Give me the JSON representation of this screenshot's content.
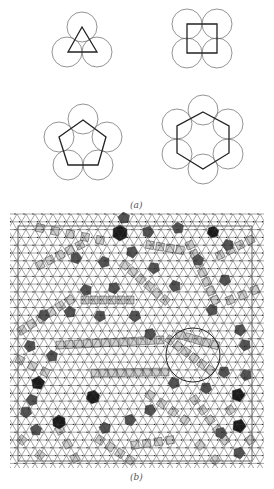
{
  "figure": {
    "panel_a": {
      "label": "(a)",
      "label_pos": [
        137,
        206
      ],
      "circle_radius": 15,
      "motifs": [
        {
          "name": "triangle-motif",
          "sides": 3,
          "circles": [
            [
              82,
              27
            ],
            [
              67,
              52
            ],
            [
              97,
              52
            ]
          ],
          "polygon": [
            [
              82,
              27
            ],
            [
              68,
              52
            ],
            [
              97,
              52
            ]
          ]
        },
        {
          "name": "square-motif",
          "sides": 4,
          "circles": [
            [
              187,
              24
            ],
            [
              217,
              24
            ],
            [
              187,
              53
            ],
            [
              217,
              53
            ]
          ],
          "polygon": [
            [
              187,
              24
            ],
            [
              217,
              24
            ],
            [
              217,
              53
            ],
            [
              187,
              53
            ]
          ]
        },
        {
          "name": "pentagon-motif",
          "sides": 5,
          "circles": [
            [
              83,
              119
            ],
            [
              59,
              137
            ],
            [
              107,
              137
            ],
            [
              68,
              165
            ],
            [
              98,
              165
            ]
          ],
          "polygon": [
            [
              83,
              120
            ],
            [
              106,
              137
            ],
            [
              98,
              165
            ],
            [
              68,
              165
            ],
            [
              59,
              137
            ]
          ]
        },
        {
          "name": "hexagon-motif",
          "sides": 6,
          "circles": [
            [
              203,
              110
            ],
            [
              228,
              124
            ],
            [
              228,
              154
            ],
            [
              203,
              169
            ],
            [
              177,
              154
            ],
            [
              177,
              124
            ]
          ],
          "polygon": [
            [
              203,
              112
            ],
            [
              229,
              126
            ],
            [
              229,
              153
            ],
            [
              203,
              169
            ],
            [
              177,
              153
            ],
            [
              177,
              126
            ]
          ]
        }
      ]
    },
    "panel_b": {
      "label": "(b)",
      "label_pos": [
        137,
        478
      ],
      "box": {
        "x": 18,
        "y": 226,
        "w": 234,
        "h": 235
      },
      "lattice_spacing": 9,
      "highlight_circle": {
        "cx": 193,
        "cy": 355,
        "r": 27
      },
      "colors": {
        "light": "#d0d0d0",
        "mid": "#8a8a8a",
        "dark": "#555555",
        "black": "#1a1a1a",
        "line": "#333333"
      },
      "tiles": [
        {
          "kind": "hex",
          "cx": 93,
          "cy": 397,
          "r": 7,
          "shade": "black"
        },
        {
          "kind": "hex",
          "cx": 59,
          "cy": 422,
          "r": 7,
          "shade": "black"
        },
        {
          "kind": "hex",
          "cx": 120,
          "cy": 233,
          "r": 8,
          "shade": "black"
        },
        {
          "kind": "hex",
          "cx": 213,
          "cy": 232,
          "r": 6,
          "shade": "black"
        },
        {
          "kind": "pent",
          "cx": 38,
          "cy": 383,
          "r": 7,
          "shade": "black"
        },
        {
          "kind": "pent",
          "cx": 239,
          "cy": 453,
          "r": 6,
          "shade": "dark"
        },
        {
          "kind": "pent",
          "cx": 238,
          "cy": 395,
          "r": 7,
          "shade": "black"
        },
        {
          "kind": "pent",
          "cx": 239,
          "cy": 426,
          "r": 7,
          "shade": "black"
        },
        {
          "kind": "pent",
          "cx": 124,
          "cy": 218,
          "r": 6,
          "shade": "dark"
        },
        {
          "kind": "pent",
          "cx": 148,
          "cy": 232,
          "r": 6,
          "shade": "dark"
        },
        {
          "kind": "pent",
          "cx": 178,
          "cy": 228,
          "r": 6,
          "shade": "dark"
        },
        {
          "kind": "pent",
          "cx": 76,
          "cy": 258,
          "r": 6,
          "shade": "dark"
        },
        {
          "kind": "pent",
          "cx": 104,
          "cy": 262,
          "r": 6,
          "shade": "dark"
        },
        {
          "kind": "pent",
          "cx": 132,
          "cy": 252,
          "r": 6,
          "shade": "dark"
        },
        {
          "kind": "pent",
          "cx": 154,
          "cy": 268,
          "r": 6,
          "shade": "dark"
        },
        {
          "kind": "pent",
          "cx": 86,
          "cy": 290,
          "r": 6,
          "shade": "dark"
        },
        {
          "kind": "pent",
          "cx": 114,
          "cy": 288,
          "r": 6,
          "shade": "dark"
        },
        {
          "kind": "pent",
          "cx": 44,
          "cy": 315,
          "r": 6,
          "shade": "dark"
        },
        {
          "kind": "pent",
          "cx": 70,
          "cy": 312,
          "r": 6,
          "shade": "dark"
        },
        {
          "kind": "pent",
          "cx": 100,
          "cy": 316,
          "r": 6,
          "shade": "dark"
        },
        {
          "kind": "pent",
          "cx": 135,
          "cy": 316,
          "r": 6,
          "shade": "dark"
        },
        {
          "kind": "pent",
          "cx": 150,
          "cy": 334,
          "r": 6,
          "shade": "dark"
        },
        {
          "kind": "pent",
          "cx": 175,
          "cy": 286,
          "r": 6,
          "shade": "dark"
        },
        {
          "kind": "pent",
          "cx": 198,
          "cy": 260,
          "r": 6,
          "shade": "dark"
        },
        {
          "kind": "pent",
          "cx": 228,
          "cy": 245,
          "r": 6,
          "shade": "dark"
        },
        {
          "kind": "pent",
          "cx": 225,
          "cy": 280,
          "r": 6,
          "shade": "dark"
        },
        {
          "kind": "pent",
          "cx": 212,
          "cy": 310,
          "r": 6,
          "shade": "dark"
        },
        {
          "kind": "pent",
          "cx": 30,
          "cy": 346,
          "r": 6,
          "shade": "dark"
        },
        {
          "kind": "pent",
          "cx": 52,
          "cy": 356,
          "r": 6,
          "shade": "dark"
        },
        {
          "kind": "pent",
          "cx": 32,
          "cy": 400,
          "r": 6,
          "shade": "dark"
        },
        {
          "kind": "pent",
          "cx": 26,
          "cy": 412,
          "r": 6,
          "shade": "dark"
        },
        {
          "kind": "pent",
          "cx": 36,
          "cy": 430,
          "r": 6,
          "shade": "dark"
        },
        {
          "kind": "pent",
          "cx": 105,
          "cy": 428,
          "r": 6,
          "shade": "dark"
        },
        {
          "kind": "pent",
          "cx": 130,
          "cy": 420,
          "r": 6,
          "shade": "dark"
        },
        {
          "kind": "pent",
          "cx": 150,
          "cy": 410,
          "r": 6,
          "shade": "dark"
        },
        {
          "kind": "pent",
          "cx": 174,
          "cy": 383,
          "r": 6,
          "shade": "dark"
        },
        {
          "kind": "pent",
          "cx": 206,
          "cy": 388,
          "r": 6,
          "shade": "dark"
        },
        {
          "kind": "pent",
          "cx": 224,
          "cy": 372,
          "r": 6,
          "shade": "dark"
        },
        {
          "kind": "pent",
          "cx": 246,
          "cy": 375,
          "r": 6,
          "shade": "dark"
        },
        {
          "kind": "pent",
          "cx": 221,
          "cy": 433,
          "r": 6,
          "shade": "dark"
        },
        {
          "kind": "pent",
          "cx": 240,
          "cy": 330,
          "r": 6,
          "shade": "dark"
        },
        {
          "kind": "pent",
          "cx": 245,
          "cy": 345,
          "r": 6,
          "shade": "dark"
        }
      ],
      "square_chains": [
        {
          "x0": 60,
          "y0": 345,
          "x1": 160,
          "y1": 340,
          "n": 12
        },
        {
          "x0": 95,
          "y0": 373,
          "x1": 165,
          "y1": 372,
          "n": 9
        },
        {
          "x0": 22,
          "y0": 330,
          "x1": 70,
          "y1": 300,
          "n": 6
        },
        {
          "x0": 40,
          "y0": 265,
          "x1": 80,
          "y1": 245,
          "n": 5
        },
        {
          "x0": 85,
          "y0": 300,
          "x1": 130,
          "y1": 300,
          "n": 6
        },
        {
          "x0": 125,
          "y0": 265,
          "x1": 165,
          "y1": 300,
          "n": 6
        },
        {
          "x0": 170,
          "y0": 340,
          "x1": 210,
          "y1": 370,
          "n": 6
        },
        {
          "x0": 180,
          "y0": 335,
          "x1": 215,
          "y1": 345,
          "n": 5
        },
        {
          "x0": 190,
          "y0": 245,
          "x1": 215,
          "y1": 300,
          "n": 7
        },
        {
          "x0": 220,
          "y0": 255,
          "x1": 250,
          "y1": 240,
          "n": 4
        },
        {
          "x0": 230,
          "y0": 300,
          "x1": 255,
          "y1": 290,
          "n": 3
        },
        {
          "x0": 40,
          "y0": 228,
          "x1": 100,
          "y1": 240,
          "n": 5
        },
        {
          "x0": 150,
          "y0": 245,
          "x1": 180,
          "y1": 250,
          "n": 4
        },
        {
          "x0": 100,
          "y0": 440,
          "x1": 130,
          "y1": 460,
          "n": 4
        },
        {
          "x0": 135,
          "y0": 445,
          "x1": 170,
          "y1": 440,
          "n": 4
        },
        {
          "x0": 60,
          "y0": 430,
          "x1": 75,
          "y1": 458,
          "n": 3
        },
        {
          "x0": 195,
          "y0": 400,
          "x1": 225,
          "y1": 440,
          "n": 5
        },
        {
          "x0": 230,
          "y0": 410,
          "x1": 250,
          "y1": 440,
          "n": 3
        },
        {
          "x0": 150,
          "y0": 395,
          "x1": 185,
          "y1": 420,
          "n": 4
        },
        {
          "x0": 20,
          "y0": 360,
          "x1": 45,
          "y1": 372,
          "n": 3
        },
        {
          "x0": 22,
          "y0": 440,
          "x1": 40,
          "y1": 455,
          "n": 2
        },
        {
          "x0": 200,
          "y0": 445,
          "x1": 215,
          "y1": 460,
          "n": 2
        }
      ]
    }
  }
}
